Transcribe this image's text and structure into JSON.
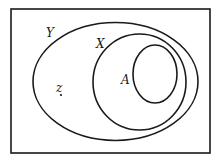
{
  "diagram": {
    "type": "venn",
    "universe": {
      "shape": "rectangle"
    },
    "sets": [
      {
        "id": "Y",
        "label": "Y",
        "contains": [
          "X"
        ]
      },
      {
        "id": "X",
        "label": "X",
        "contains": [
          "A"
        ]
      },
      {
        "id": "A",
        "label": "A",
        "contains": []
      }
    ],
    "points": [
      {
        "label": "z",
        "in_set": "Y",
        "outside": [
          "X",
          "A"
        ]
      }
    ],
    "colors": {
      "stroke": "#1a1a1a",
      "background": "#ffffff"
    }
  }
}
